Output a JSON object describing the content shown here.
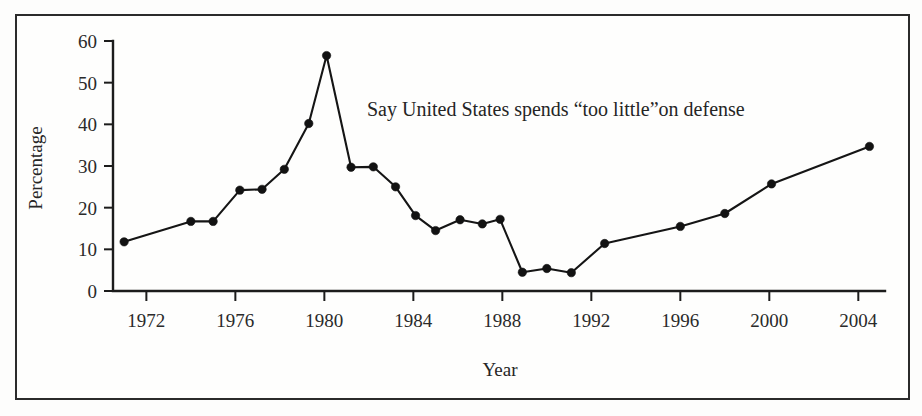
{
  "figure": {
    "background_color": "#fdfdfc",
    "frame_color": "#2b2b2b",
    "line_color": "#151515"
  },
  "chart_data": {
    "type": "line",
    "title": "",
    "annotation": "Say United States spends “too little”on defense",
    "xlabel": "Year",
    "ylabel": "Percentage",
    "xlim": [
      1970.5,
      2005.2
    ],
    "ylim": [
      0,
      60
    ],
    "grid": false,
    "legend": "none",
    "xticks": [
      1972,
      1976,
      1980,
      1984,
      1988,
      1992,
      1996,
      2000,
      2004
    ],
    "xtick_labels": [
      "1972",
      "1976",
      "1980",
      "1984",
      "1988",
      "1992",
      "1996",
      "2000",
      "2004"
    ],
    "yticks": [
      0,
      10,
      20,
      30,
      40,
      50,
      60
    ],
    "ytick_labels": [
      "0",
      "10",
      "20",
      "30",
      "40",
      "50",
      "60"
    ],
    "series": [
      {
        "name": "Say United States spends “too little” on defense",
        "marker": "circle",
        "x": [
          1971.0,
          1974.0,
          1975.0,
          1976.2,
          1977.2,
          1978.2,
          1979.3,
          1980.1,
          1981.2,
          1982.2,
          1983.2,
          1984.1,
          1985.0,
          1986.1,
          1987.1,
          1987.9,
          1988.9,
          1990.0,
          1991.1,
          1992.6,
          1996.0,
          1998.0,
          2000.1,
          2004.5
        ],
        "y": [
          11.8,
          16.7,
          16.7,
          24.2,
          24.4,
          29.2,
          40.2,
          56.5,
          29.7,
          29.8,
          25.0,
          18.1,
          14.5,
          17.1,
          16.1,
          17.2,
          4.5,
          5.4,
          4.4,
          11.4,
          15.5,
          18.6,
          25.7,
          34.7
        ]
      }
    ]
  }
}
